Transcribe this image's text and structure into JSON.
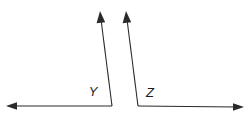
{
  "figure": {
    "type": "geometry-diagram",
    "width": 250,
    "height": 119,
    "background_color": "#ffffff",
    "stroke_color": "#2a2a2a",
    "stroke_width": 1.1,
    "label_color": "#1d1d1d",
    "angles": [
      {
        "label": "Y",
        "label_x": 93,
        "label_y": 96,
        "vertex_x": 112,
        "vertex_y": 106,
        "rays": [
          {
            "name": "horizontal-left-ray",
            "tip_x": 6,
            "tip_y": 106,
            "direction": "left"
          },
          {
            "name": "slanted-up-ray",
            "tip_x": 100,
            "tip_y": 11,
            "direction": "up"
          }
        ]
      },
      {
        "label": "Z",
        "label_x": 150,
        "label_y": 97,
        "vertex_x": 138,
        "vertex_y": 106,
        "rays": [
          {
            "name": "slanted-up-ray",
            "tip_x": 126,
            "tip_y": 11,
            "direction": "up"
          },
          {
            "name": "horizontal-right-ray",
            "tip_x": 244,
            "tip_y": 107,
            "direction": "right"
          }
        ]
      }
    ]
  }
}
